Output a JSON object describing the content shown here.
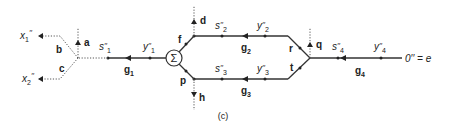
{
  "diagram": {
    "type": "signal-flow-graph",
    "caption": "(c)",
    "sum_node": {
      "symbol": "Σ"
    },
    "outputs": [
      {
        "name": "x",
        "sub": "1",
        "prime": "′′"
      },
      {
        "name": "x",
        "sub": "2",
        "prime": "′′"
      }
    ],
    "end_label": "0′′ = e",
    "node_labels": {
      "a": "a",
      "b": "b",
      "c": "c",
      "d": "d",
      "f": "f",
      "p": "p",
      "h": "h",
      "q": "q",
      "r": "r",
      "t": "t"
    },
    "signals": [
      {
        "name": "s",
        "sub": "1",
        "prime": "′′"
      },
      {
        "name": "y",
        "sub": "1",
        "prime": "′′"
      },
      {
        "name": "s",
        "sub": "2",
        "prime": "′′"
      },
      {
        "name": "y",
        "sub": "2",
        "prime": "′′"
      },
      {
        "name": "s",
        "sub": "3",
        "prime": "′′"
      },
      {
        "name": "y",
        "sub": "3",
        "prime": "′′"
      },
      {
        "name": "s",
        "sub": "4",
        "prime": "′′"
      },
      {
        "name": "y",
        "sub": "4",
        "prime": "′′"
      }
    ],
    "gains": [
      {
        "name": "g",
        "sub": "1"
      },
      {
        "name": "g",
        "sub": "2"
      },
      {
        "name": "g",
        "sub": "3"
      },
      {
        "name": "g",
        "sub": "4"
      }
    ]
  }
}
